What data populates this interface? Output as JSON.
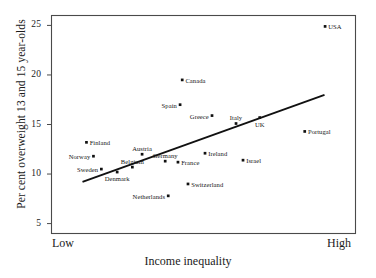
{
  "chart_data": {
    "type": "scatter",
    "title": "",
    "xlabel": "Income inequality",
    "ylabel": "Per cent overweight 13 and 15 year-olds",
    "x_axis": {
      "min_label": "Low",
      "max_label": "High",
      "ticks": []
    },
    "y_axis": {
      "ticks": [
        "5",
        "10",
        "15",
        "20",
        "25"
      ],
      "tick_values": [
        5,
        10,
        15,
        20,
        25
      ],
      "ylim": [
        4,
        26
      ]
    },
    "grid": false,
    "legend": null,
    "points": [
      {
        "label": "USA",
        "x": 90.0,
        "y": 24.9,
        "label_pos": "right"
      },
      {
        "label": "Canada",
        "x": 43.0,
        "y": 19.5,
        "label_pos": "right"
      },
      {
        "label": "Spain",
        "x": 42.3,
        "y": 17.0,
        "label_pos": "left"
      },
      {
        "label": "Greece",
        "x": 52.8,
        "y": 15.9,
        "label_pos": "left"
      },
      {
        "label": "Italy",
        "x": 60.7,
        "y": 15.1,
        "label_pos": "above"
      },
      {
        "label": "UK",
        "x": 68.5,
        "y": 15.7,
        "label_pos": "below"
      },
      {
        "label": "Portugal",
        "x": 83.3,
        "y": 14.3,
        "label_pos": "right"
      },
      {
        "label": "Finland",
        "x": 11.5,
        "y": 13.2,
        "label_pos": "right"
      },
      {
        "label": "Austria",
        "x": 29.8,
        "y": 12.0,
        "label_pos": "above"
      },
      {
        "label": "Ireland",
        "x": 50.5,
        "y": 12.1,
        "label_pos": "right"
      },
      {
        "label": "Israel",
        "x": 63.0,
        "y": 11.4,
        "label_pos": "right"
      },
      {
        "label": "Norway",
        "x": 13.8,
        "y": 11.8,
        "label_pos": "left"
      },
      {
        "label": "Germany",
        "x": 37.4,
        "y": 11.3,
        "label_pos": "above"
      },
      {
        "label": "France",
        "x": 41.6,
        "y": 11.2,
        "label_pos": "right"
      },
      {
        "label": "Belgium",
        "x": 26.6,
        "y": 10.7,
        "label_pos": "above"
      },
      {
        "label": "Sweden",
        "x": 16.4,
        "y": 10.5,
        "label_pos": "left"
      },
      {
        "label": "Denmark",
        "x": 21.6,
        "y": 10.2,
        "label_pos": "below"
      },
      {
        "label": "Switzerland",
        "x": 44.9,
        "y": 9.0,
        "label_pos": "right"
      },
      {
        "label": "Netherlands",
        "x": 38.4,
        "y": 7.8,
        "label_pos": "left"
      }
    ],
    "trend_line": {
      "x_start": 10.2,
      "y_start": 9.2,
      "x_end": 89.8,
      "y_end": 18.0,
      "color": "#111111"
    }
  }
}
